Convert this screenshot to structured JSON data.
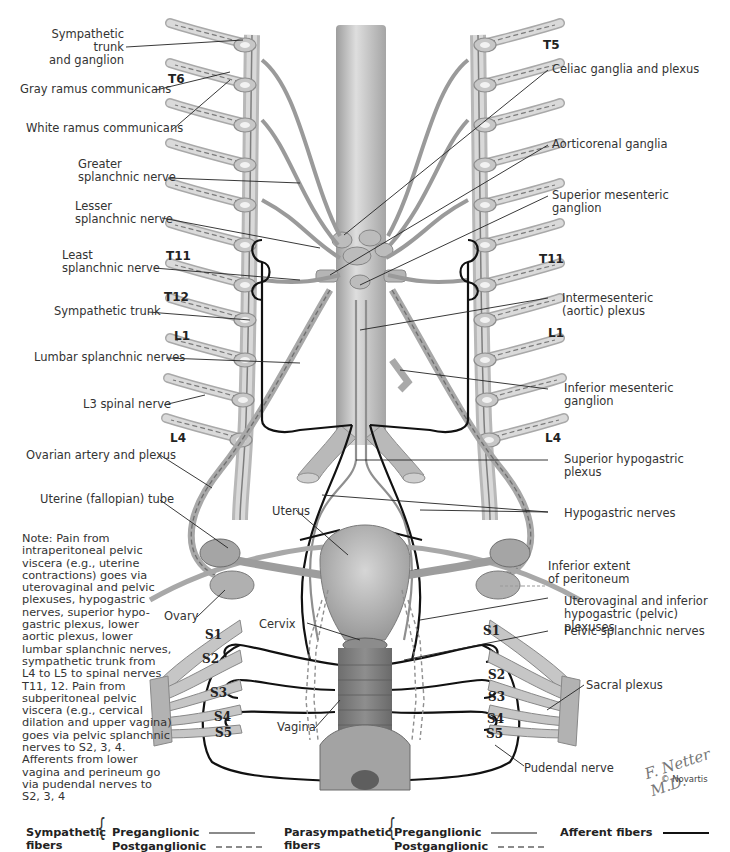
{
  "diagram": {
    "colors": {
      "background": "#ffffff",
      "tissue": "#c9c9c9",
      "tissue_dark": "#8f8f8f",
      "afferent": "#111111",
      "label_line": "#222222"
    }
  },
  "left_labels": [
    {
      "id": "symp-trunk-ganglion",
      "text": "Sympathetic trunk\nand ganglion"
    },
    {
      "id": "gray-ramus",
      "text": "Gray ramus communicans"
    },
    {
      "id": "white-ramus",
      "text": "White ramus communicans"
    },
    {
      "id": "greater-splanchnic",
      "text": "Greater\nsplanchnic nerve"
    },
    {
      "id": "lesser-splanchnic",
      "text": "Lesser\nsplanchnic nerve"
    },
    {
      "id": "least-splanchnic",
      "text": "Least\nsplanchnic nerve"
    },
    {
      "id": "symp-trunk",
      "text": "Sympathetic trunk"
    },
    {
      "id": "lumbar-splanchnic",
      "text": "Lumbar splanchnic nerves"
    },
    {
      "id": "l3-spinal",
      "text": "L3 spinal nerve"
    },
    {
      "id": "ovarian-artery",
      "text": "Ovarian artery and plexus"
    },
    {
      "id": "uterine-tube",
      "text": "Uterine (fallopian) tube"
    },
    {
      "id": "ovary",
      "text": "Ovary"
    }
  ],
  "right_labels": [
    {
      "id": "celiac",
      "text": "Celiac ganglia and plexus"
    },
    {
      "id": "aorticorenal",
      "text": "Aorticorenal ganglia"
    },
    {
      "id": "sup-mesenteric",
      "text": "Superior mesenteric\nganglion"
    },
    {
      "id": "intermesenteric",
      "text": "Intermesenteric\n(aortic) plexus"
    },
    {
      "id": "inf-mesenteric",
      "text": "Inferior mesenteric\nganglion"
    },
    {
      "id": "sup-hypogastric",
      "text": "Superior hypogastric\nplexus"
    },
    {
      "id": "hypogastric-nerves",
      "text": "Hypogastric nerves"
    },
    {
      "id": "inferior-peritoneum",
      "text": "Inferior extent\nof peritoneum"
    },
    {
      "id": "uterovaginal",
      "text": "Uterovaginal and inferior\nhypogastric (pelvic) plexuses"
    },
    {
      "id": "pelvic-splanchnic",
      "text": "Pelvic splanchnic nerves"
    },
    {
      "id": "sacral-plexus",
      "text": "Sacral plexus"
    },
    {
      "id": "pudendal",
      "text": "Pudendal nerve"
    }
  ],
  "center_labels": [
    {
      "id": "uterus",
      "text": "Uterus"
    },
    {
      "id": "cervix",
      "text": "Cervix"
    },
    {
      "id": "vagina",
      "text": "Vagina"
    }
  ],
  "vertebral_levels": {
    "left": [
      "T6",
      "T11",
      "T12",
      "L1",
      "L4"
    ],
    "right": [
      "T5",
      "T11",
      "L1",
      "L4"
    ],
    "sacral_left": [
      "S1",
      "S2",
      "S3",
      "S4",
      "S5"
    ],
    "sacral_right": [
      "S1",
      "S2",
      "S3",
      "S4",
      "S5"
    ]
  },
  "note": "Note: Pain from intraperitoneal pelvic viscera (e.g., uterine contractions) goes via uterovaginal and pelvic plexuses, hypogastric nerves, superior hypo-gastric plexus, lower aortic plexus, lower lumbar splanchnic nerves, sympathetic trunk from L4 to L5 to spinal nerves T11, 12. Pain from subperitoneal pelvic viscera (e.g., cervical dilation and upper vagina) goes via pelvic splanchnic nerves to S2, 3, 4. Afferents from lower vagina and perineum go via pudendal nerves to S2, 3, 4",
  "legend": {
    "sympathetic": {
      "label": "Sympathetic\nfibers",
      "pre": "Preganglionic",
      "post": "Postganglionic"
    },
    "parasympathetic": {
      "label": "Parasympathetic\nfibers",
      "pre": "Preganglionic",
      "post": "Postganglionic"
    },
    "afferent": {
      "label": "Afferent fibers"
    }
  },
  "signature": "F. Netter M.D.",
  "copyright": "© Novartis"
}
